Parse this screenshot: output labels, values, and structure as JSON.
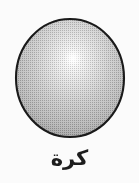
{
  "figure": {
    "kind": "geometric-solid-illustration",
    "shape_name": "sphere",
    "caption": "كرة",
    "caption_language": "Arabic",
    "caption_meaning": "sphere",
    "background_color": "#fbfbfb",
    "outline_color": "#1a1a1a",
    "outline_width_px": 2,
    "fill_light_color": "#f2f2f2",
    "fill_mid_color": "#a9a9a9",
    "fill_dark_color": "#7e7e7e",
    "highlight_color": "#fdfdfd",
    "caption_color": "#1d1d1d",
    "texture": "halftone-dots",
    "geometry": {
      "center_x": 70,
      "center_y": 78,
      "radius_x": 54,
      "radius_y": 59,
      "highlight_x": 73,
      "highlight_y": 58,
      "highlight_radius": 6
    }
  }
}
